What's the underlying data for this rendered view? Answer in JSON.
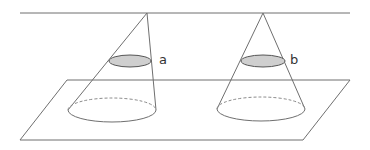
{
  "diagram": {
    "title": "",
    "colors": {
      "line": "#6f6f6f",
      "section_fill": "#cfcfcf",
      "background": "#ffffff"
    },
    "upper_line": {
      "x1": 20,
      "y1": 13,
      "x2": 350,
      "y2": 13
    },
    "plane": {
      "points": "67,80 350,80 303,140 20,140"
    },
    "cones": [
      {
        "id": "a",
        "label": "a",
        "apex": {
          "x": 147,
          "y": 13
        },
        "base": {
          "cx": 112,
          "cy": 110,
          "rx": 44,
          "ry": 12
        },
        "section": {
          "cx": 130,
          "cy": 61,
          "rx": 21,
          "ry": 6
        },
        "label_pos": {
          "x": 159,
          "y": 54
        }
      },
      {
        "id": "b",
        "label": "b",
        "apex": {
          "x": 263,
          "y": 13
        },
        "base": {
          "cx": 261,
          "cy": 109,
          "rx": 44,
          "ry": 12
        },
        "section": {
          "cx": 263,
          "cy": 61,
          "rx": 22,
          "ry": 6
        },
        "label_pos": {
          "x": 291,
          "y": 54
        }
      }
    ]
  }
}
